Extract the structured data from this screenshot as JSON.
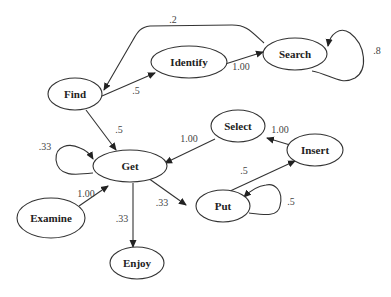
{
  "diagram": {
    "type": "state-transition-graph",
    "nodes": [
      {
        "id": "find",
        "label": "Find"
      },
      {
        "id": "identify",
        "label": "Identify"
      },
      {
        "id": "search",
        "label": "Search"
      },
      {
        "id": "get",
        "label": "Get"
      },
      {
        "id": "select",
        "label": "Select"
      },
      {
        "id": "insert",
        "label": "Insert"
      },
      {
        "id": "put",
        "label": "Put"
      },
      {
        "id": "examine",
        "label": "Examine"
      },
      {
        "id": "enjoy",
        "label": "Enjoy"
      }
    ],
    "edges": [
      {
        "from": "search",
        "to": "find",
        "label": ".2"
      },
      {
        "from": "find",
        "to": "identify",
        "label": ".5"
      },
      {
        "from": "identify",
        "to": "search",
        "label": "1.00"
      },
      {
        "from": "search",
        "to": "search",
        "label": ".8"
      },
      {
        "from": "find",
        "to": "get",
        "label": ".5"
      },
      {
        "from": "get",
        "to": "get",
        "label": ".33"
      },
      {
        "from": "select",
        "to": "get",
        "label": "1.00"
      },
      {
        "from": "insert",
        "to": "select",
        "label": "1.00"
      },
      {
        "from": "put",
        "to": "insert",
        "label": ".5"
      },
      {
        "from": "put",
        "to": "put",
        "label": ".5"
      },
      {
        "from": "get",
        "to": "put",
        "label": ".33"
      },
      {
        "from": "examine",
        "to": "get",
        "label": "1.00"
      },
      {
        "from": "get",
        "to": "enjoy",
        "label": ".33"
      }
    ]
  }
}
